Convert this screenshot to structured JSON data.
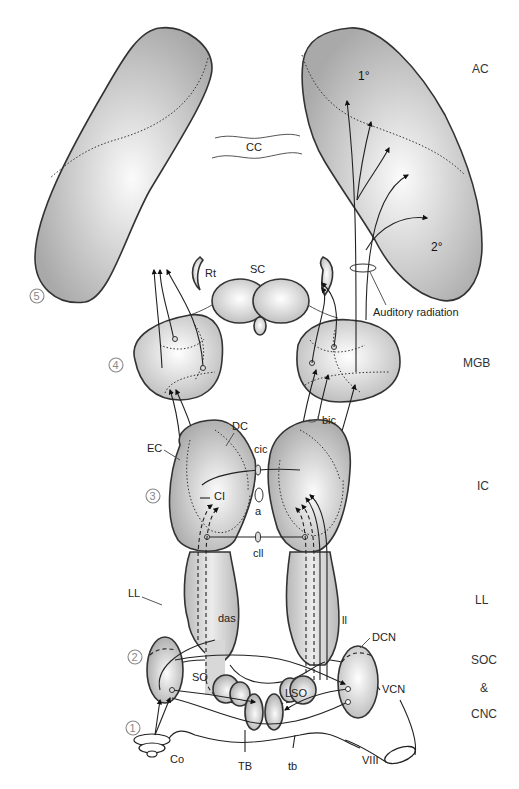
{
  "diagram": {
    "level_labels": [
      {
        "id": "ac",
        "text": "AC"
      },
      {
        "id": "mgb",
        "text": "MGB"
      },
      {
        "id": "ic",
        "text": "IC"
      },
      {
        "id": "ll",
        "text": "LL"
      },
      {
        "id": "soc",
        "text": "SOC"
      },
      {
        "id": "amp",
        "text": "&"
      },
      {
        "id": "cnc",
        "text": "CNC"
      }
    ],
    "cortex": {
      "primary": "1°",
      "secondary": "2°",
      "corpus_callosum": "CC",
      "auditory_radiation": "Auditory radiation"
    },
    "structure_labels": {
      "rt": "Rt",
      "sc": "SC",
      "bic": "bic",
      "dc": "DC",
      "ec": "EC",
      "cic": "cic",
      "ci": "CI",
      "a": "a",
      "cll": "cll",
      "ll": "LL",
      "das": "das",
      "ll_small": "ll",
      "dcn": "DCN",
      "vcn": "VCN",
      "so": "SO",
      "lso": "LSO",
      "co": "Co",
      "tb_upper": "TB",
      "tb_lower": "tb",
      "viii": "VIII"
    },
    "level_numbers": [
      "1",
      "2",
      "3",
      "4",
      "5"
    ],
    "colors": {
      "structure_fill_light": "#f5f5f5",
      "structure_fill_dark": "#a8a8a8",
      "outline": "#333333",
      "number_gray": "#888888"
    }
  }
}
